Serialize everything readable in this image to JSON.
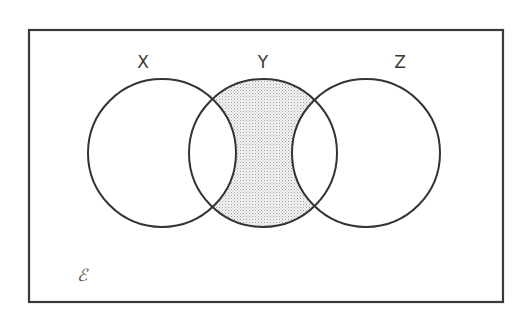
{
  "diagram": {
    "type": "venn",
    "universe": {
      "symbol": "ℰ",
      "rect": {
        "x": 29,
        "y": 30,
        "width": 474,
        "height": 272
      }
    },
    "sets": [
      {
        "id": "X",
        "label": "X",
        "cx": 162,
        "cy": 153,
        "r": 74
      },
      {
        "id": "Y",
        "label": "Y",
        "cx": 263,
        "cy": 153,
        "r": 74
      },
      {
        "id": "Z",
        "label": "Z",
        "cx": 366,
        "cy": 153,
        "r": 74
      }
    ],
    "shaded_region": "Y ∩ X' ∩ Z'",
    "shaded_description": "Part of Y not in X or Z",
    "colors": {
      "stroke": "#333333",
      "shade_dot": "#9a9a9a",
      "shade_bg": "#f3f3f3",
      "background": "#ffffff"
    }
  }
}
